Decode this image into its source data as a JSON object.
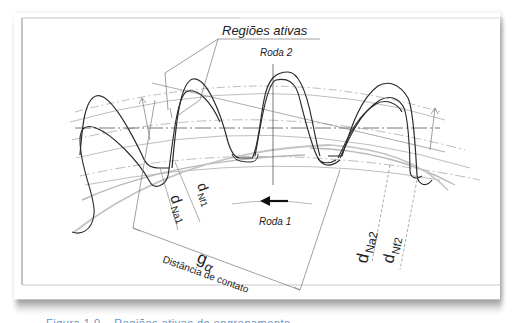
{
  "figure": {
    "callout_title": "Regiões ativas",
    "wheel_2_label": "Roda 2",
    "wheel_1_label": "Roda 1",
    "labels": {
      "dNa1": {
        "main": "d",
        "sub": "Na1"
      },
      "dNf1": {
        "main": "d",
        "sub": "Nf1"
      },
      "dNa2": {
        "main": "d",
        "sub": "Na2"
      },
      "dNf2": {
        "main": "d",
        "sub": "Nf2"
      },
      "g_alpha": {
        "main": "g",
        "sub": "α"
      }
    },
    "contact_distance_label": "Distância de contato",
    "rotation_arrow_direction": "left"
  },
  "caption": {
    "text": "Figura 1.0 – Regiões ativas do engrenamento"
  },
  "colors": {
    "line": "#2a2a2a",
    "construction_line": "#9a9a9a",
    "frame_border": "#9e9e9e",
    "card_shadow": "#bdbdbd",
    "caption": "#6a8fc4"
  }
}
